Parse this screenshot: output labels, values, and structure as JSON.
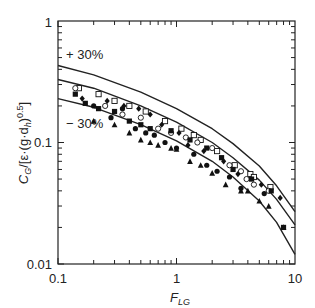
{
  "chart_data": {
    "type": "scatter",
    "title": "",
    "xlabel": "F_LG",
    "ylabel": "C_G/[ε·(g·d_h)^0.5]",
    "xscale": "log",
    "yscale": "log",
    "xlim": [
      0.1,
      10
    ],
    "ylim": [
      0.01,
      1
    ],
    "x_ticks": [
      "0.1",
      "1",
      "10"
    ],
    "y_ticks": [
      "0.01",
      "0.1",
      "1"
    ],
    "grid": false,
    "legend": null,
    "annotations": [
      "+ 30%",
      "− 30%"
    ],
    "lines": [
      {
        "name": "+30%",
        "x": [
          0.1,
          0.2,
          0.5,
          1,
          2,
          3,
          5,
          7,
          10
        ],
        "y": [
          0.43,
          0.36,
          0.26,
          0.19,
          0.13,
          0.098,
          0.064,
          0.044,
          0.027
        ]
      },
      {
        "name": "correlation",
        "x": [
          0.1,
          0.2,
          0.5,
          1,
          2,
          3,
          5,
          7,
          10
        ],
        "y": [
          0.33,
          0.28,
          0.2,
          0.147,
          0.1,
          0.075,
          0.049,
          0.034,
          0.021
        ]
      },
      {
        "name": "-30%",
        "x": [
          0.1,
          0.2,
          0.5,
          1,
          2,
          3,
          5,
          7,
          10
        ],
        "y": [
          0.23,
          0.195,
          0.14,
          0.103,
          0.07,
          0.052,
          0.033,
          0.022,
          0.012
        ]
      }
    ],
    "series": [
      {
        "name": "open-square",
        "marker": "square-open",
        "points": [
          [
            0.15,
            0.28
          ],
          [
            0.22,
            0.25
          ],
          [
            0.3,
            0.22
          ],
          [
            0.4,
            0.2
          ],
          [
            0.55,
            0.18
          ],
          [
            0.8,
            0.15
          ],
          [
            1.1,
            0.13
          ],
          [
            1.4,
            0.115
          ],
          [
            1.6,
            0.105
          ],
          [
            2.2,
            0.085
          ],
          [
            3.1,
            0.065
          ],
          [
            4.2,
            0.055
          ],
          [
            4.5,
            0.052
          ],
          [
            6.2,
            0.043
          ]
        ]
      },
      {
        "name": "open-circle",
        "marker": "circle-open",
        "points": [
          [
            0.14,
            0.28
          ],
          [
            0.25,
            0.2
          ],
          [
            0.35,
            0.17
          ],
          [
            0.5,
            0.16
          ],
          [
            0.7,
            0.13
          ],
          [
            0.9,
            0.12
          ],
          [
            1.2,
            0.11
          ],
          [
            1.5,
            0.1
          ],
          [
            2.0,
            0.09
          ],
          [
            2.8,
            0.065
          ],
          [
            3.5,
            0.058
          ],
          [
            3.9,
            0.05
          ],
          [
            4.5,
            0.045
          ],
          [
            6.0,
            0.04
          ]
        ]
      },
      {
        "name": "filled-square",
        "marker": "square-filled",
        "points": [
          [
            0.14,
            0.25
          ],
          [
            0.17,
            0.21
          ],
          [
            0.22,
            0.19
          ],
          [
            0.3,
            0.18
          ],
          [
            0.4,
            0.15
          ],
          [
            0.5,
            0.14
          ],
          [
            0.6,
            0.13
          ],
          [
            0.9,
            0.125
          ],
          [
            1.3,
            0.105
          ],
          [
            1.8,
            0.09
          ],
          [
            2.4,
            0.075
          ],
          [
            3.0,
            0.06
          ],
          [
            4.3,
            0.05
          ],
          [
            6.3,
            0.04
          ],
          [
            8.0,
            0.02
          ]
        ]
      },
      {
        "name": "filled-circle",
        "marker": "circle-filled",
        "points": [
          [
            0.2,
            0.2
          ],
          [
            0.28,
            0.16
          ],
          [
            0.35,
            0.19
          ],
          [
            0.45,
            0.13
          ],
          [
            0.55,
            0.12
          ],
          [
            0.65,
            0.115
          ],
          [
            0.8,
            0.1
          ],
          [
            1.0,
            0.09
          ],
          [
            1.4,
            0.08
          ],
          [
            1.8,
            0.065
          ],
          [
            2.2,
            0.058
          ],
          [
            2.8,
            0.052
          ],
          [
            3.5,
            0.042
          ],
          [
            5.5,
            0.038
          ]
        ]
      },
      {
        "name": "filled-triangle",
        "marker": "triangle-filled",
        "points": [
          [
            0.2,
            0.15
          ],
          [
            0.3,
            0.14
          ],
          [
            0.4,
            0.12
          ],
          [
            0.5,
            0.105
          ],
          [
            0.6,
            0.1
          ],
          [
            0.7,
            0.095
          ],
          [
            0.9,
            0.09
          ],
          [
            1.0,
            0.088
          ],
          [
            1.3,
            0.07
          ],
          [
            1.6,
            0.065
          ],
          [
            2.0,
            0.056
          ],
          [
            2.6,
            0.045
          ],
          [
            3.5,
            0.04
          ],
          [
            4.0,
            0.04
          ],
          [
            5.0,
            0.033
          ],
          [
            6.0,
            0.03
          ],
          [
            8.0,
            0.02
          ]
        ]
      },
      {
        "name": "filled-diamond",
        "marker": "diamond-filled",
        "points": [
          [
            0.16,
            0.23
          ],
          [
            0.26,
            0.22
          ],
          [
            0.36,
            0.2
          ],
          [
            0.48,
            0.19
          ],
          [
            0.6,
            0.17
          ],
          [
            0.75,
            0.14
          ],
          [
            1.05,
            0.12
          ],
          [
            1.25,
            0.095
          ],
          [
            1.7,
            0.085
          ],
          [
            2.5,
            0.07
          ],
          [
            3.3,
            0.055
          ],
          [
            5.2,
            0.045
          ],
          [
            7.5,
            0.035
          ]
        ]
      }
    ]
  },
  "labels": {
    "y_tick_1": "1",
    "y_tick_01": "0.1",
    "y_tick_001": "0.01",
    "x_tick_01": "0.1",
    "x_tick_1": "1",
    "x_tick_10": "10",
    "plus30": "+ 30%",
    "minus30": "− 30%",
    "xlabel_main": "F",
    "xlabel_sub": "LG",
    "ylabel_parts": {
      "c": "C",
      "g_sub": "G",
      "mid": "/[ε·(g·d",
      "h_sub": "h",
      "close": ")",
      "exp": "0.5",
      "end": "]"
    }
  },
  "colors": {
    "axis": "#222222",
    "line": "#222222",
    "marker": "#111111",
    "background": "#ffffff"
  }
}
